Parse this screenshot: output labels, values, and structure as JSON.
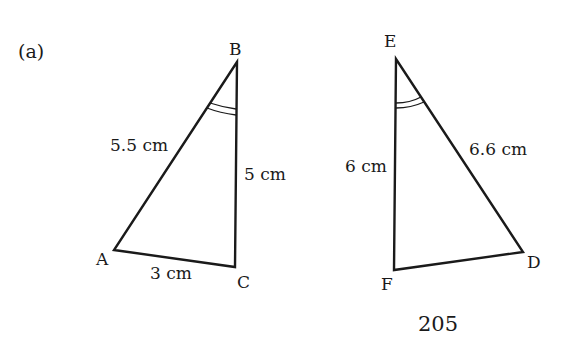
{
  "figure": {
    "part_label": "(a)",
    "page_number": "205"
  },
  "triangle_abc": {
    "vertices": {
      "A": "A",
      "B": "B",
      "C": "C"
    },
    "sides": {
      "AB": "5.5 cm",
      "BC": "5 cm",
      "AC": "3 cm"
    },
    "marked_angle": "B"
  },
  "triangle_def": {
    "vertices": {
      "D": "D",
      "E": "E",
      "F": "F"
    },
    "sides": {
      "FE": "6 cm",
      "ED": "6.6 cm"
    },
    "marked_angle": "E"
  },
  "colors": {
    "stroke": "#1a1a1a",
    "background": "#ffffff"
  }
}
